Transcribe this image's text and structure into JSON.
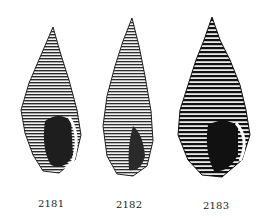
{
  "figures": [
    {
      "label": "2181",
      "x": 15,
      "y": 25,
      "w": 70,
      "h": 148
    },
    {
      "label": "2182",
      "x": 97,
      "y": 16,
      "w": 60,
      "h": 160
    },
    {
      "label": "2183",
      "x": 170,
      "y": 15,
      "w": 82,
      "h": 163
    }
  ],
  "colors": {
    "ink": "#1a1a1a",
    "paper": "#ffffff"
  }
}
